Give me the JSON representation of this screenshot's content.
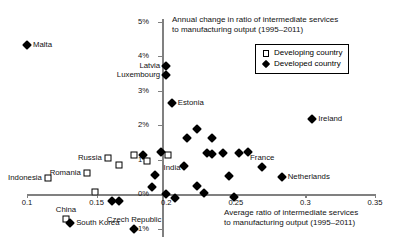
{
  "chart_data": {
    "type": "scatter",
    "title": "",
    "xlabel": "Average ratio of intermediate services to manufacturing output (1995-2011)",
    "ylabel": "Annual change in ratio of intermediate services to manufacturing output (1995-2011)",
    "xlabel_line1": "Average ratio of intermediate services",
    "xlabel_line2": "to manufacturing output (1995–2011)",
    "ylabel_line1": "Annual change in ratio of intermediate services",
    "ylabel_line2": "to manufacturing output (1995–2011)",
    "xlim": [
      0.1,
      0.35
    ],
    "ylim": [
      -0.01,
      0.05
    ],
    "xticks": [
      "0.1",
      "0.15",
      "0.2",
      "0.25",
      "0.3",
      "0.35"
    ],
    "xtick_values": [
      0.1,
      0.15,
      0.2,
      0.25,
      0.3,
      0.35
    ],
    "yticks": [
      "5%",
      "4%",
      "3%",
      "2%",
      "1%",
      "0%",
      "-1%"
    ],
    "ytick_values": [
      5,
      4,
      3,
      2,
      1,
      0,
      -1
    ],
    "grid": false,
    "legend_position": "top-right",
    "legend": [
      {
        "marker": "square",
        "label": "Developing country"
      },
      {
        "marker": "diamond",
        "label": "Developed country"
      }
    ],
    "series": [
      {
        "name": "Developing country",
        "marker": "square",
        "points": [
          {
            "label": "Indonesia",
            "x": 0.115,
            "y": 0.45,
            "label_pos": "left"
          },
          {
            "label": "Romania",
            "x": 0.143,
            "y": 0.62,
            "label_pos": "left"
          },
          {
            "label": "Russia",
            "x": 0.158,
            "y": 1.05,
            "label_pos": "left"
          },
          {
            "label": "China",
            "x": 0.128,
            "y": -0.72,
            "label_pos": "above"
          },
          {
            "label": "India",
            "x": 0.201,
            "y": 1.12,
            "label_pos": "below"
          },
          {
            "label": "",
            "x": 0.149,
            "y": 0.05,
            "label_pos": "none"
          },
          {
            "label": "",
            "x": 0.166,
            "y": 0.85,
            "label_pos": "none"
          },
          {
            "label": "",
            "x": 0.177,
            "y": 1.12,
            "label_pos": "none"
          },
          {
            "label": "",
            "x": 0.186,
            "y": 0.95,
            "label_pos": "none"
          }
        ]
      },
      {
        "name": "Developed country",
        "marker": "diamond",
        "points": [
          {
            "label": "Malta",
            "x": 0.1,
            "y": 4.33,
            "label_pos": "right"
          },
          {
            "label": "Latvia",
            "x": 0.2,
            "y": 3.72,
            "label_pos": "left"
          },
          {
            "label": "Luxembourg",
            "x": 0.2,
            "y": 3.44,
            "label_pos": "left"
          },
          {
            "label": "Estonia",
            "x": 0.204,
            "y": 2.65,
            "label_pos": "right"
          },
          {
            "label": "Ireland",
            "x": 0.305,
            "y": 2.17,
            "label_pos": "right"
          },
          {
            "label": "France",
            "x": 0.269,
            "y": 0.78,
            "label_pos": "above"
          },
          {
            "label": "Netherlands",
            "x": 0.283,
            "y": 0.49,
            "label_pos": "right"
          },
          {
            "label": "South Korea",
            "x": 0.131,
            "y": -0.83,
            "label_pos": "right"
          },
          {
            "label": "Czech Republic",
            "x": 0.177,
            "y": -1.02,
            "label_pos": "above"
          },
          {
            "label": "",
            "x": 0.222,
            "y": 1.88,
            "label_pos": "none"
          },
          {
            "label": "",
            "x": 0.215,
            "y": 1.62,
            "label_pos": "none"
          },
          {
            "label": "",
            "x": 0.233,
            "y": 1.62,
            "label_pos": "none"
          },
          {
            "label": "",
            "x": 0.196,
            "y": 1.22,
            "label_pos": "none"
          },
          {
            "label": "",
            "x": 0.229,
            "y": 1.2,
            "label_pos": "none"
          },
          {
            "label": "",
            "x": 0.233,
            "y": 1.15,
            "label_pos": "none"
          },
          {
            "label": "",
            "x": 0.241,
            "y": 1.2,
            "label_pos": "none"
          },
          {
            "label": "",
            "x": 0.252,
            "y": 1.2,
            "label_pos": "none"
          },
          {
            "label": "",
            "x": 0.259,
            "y": 1.22,
            "label_pos": "none"
          },
          {
            "label": "",
            "x": 0.183,
            "y": 1.12,
            "label_pos": "none"
          },
          {
            "label": "",
            "x": 0.213,
            "y": 0.82,
            "label_pos": "none"
          },
          {
            "label": "",
            "x": 0.192,
            "y": 0.55,
            "label_pos": "none"
          },
          {
            "label": "",
            "x": 0.245,
            "y": 0.52,
            "label_pos": "none"
          },
          {
            "label": "",
            "x": 0.19,
            "y": 0.2,
            "label_pos": "none"
          },
          {
            "label": "",
            "x": 0.222,
            "y": 0.22,
            "label_pos": "none"
          },
          {
            "label": "",
            "x": 0.2,
            "y": 0.0,
            "label_pos": "none"
          },
          {
            "label": "",
            "x": 0.227,
            "y": 0.04,
            "label_pos": "none"
          },
          {
            "label": "",
            "x": 0.249,
            "y": -0.08,
            "label_pos": "none"
          },
          {
            "label": "",
            "x": 0.206,
            "y": -0.12,
            "label_pos": "none"
          },
          {
            "label": "",
            "x": 0.161,
            "y": -0.2,
            "label_pos": "none"
          },
          {
            "label": "",
            "x": 0.166,
            "y": -0.2,
            "label_pos": "none"
          }
        ]
      }
    ]
  }
}
